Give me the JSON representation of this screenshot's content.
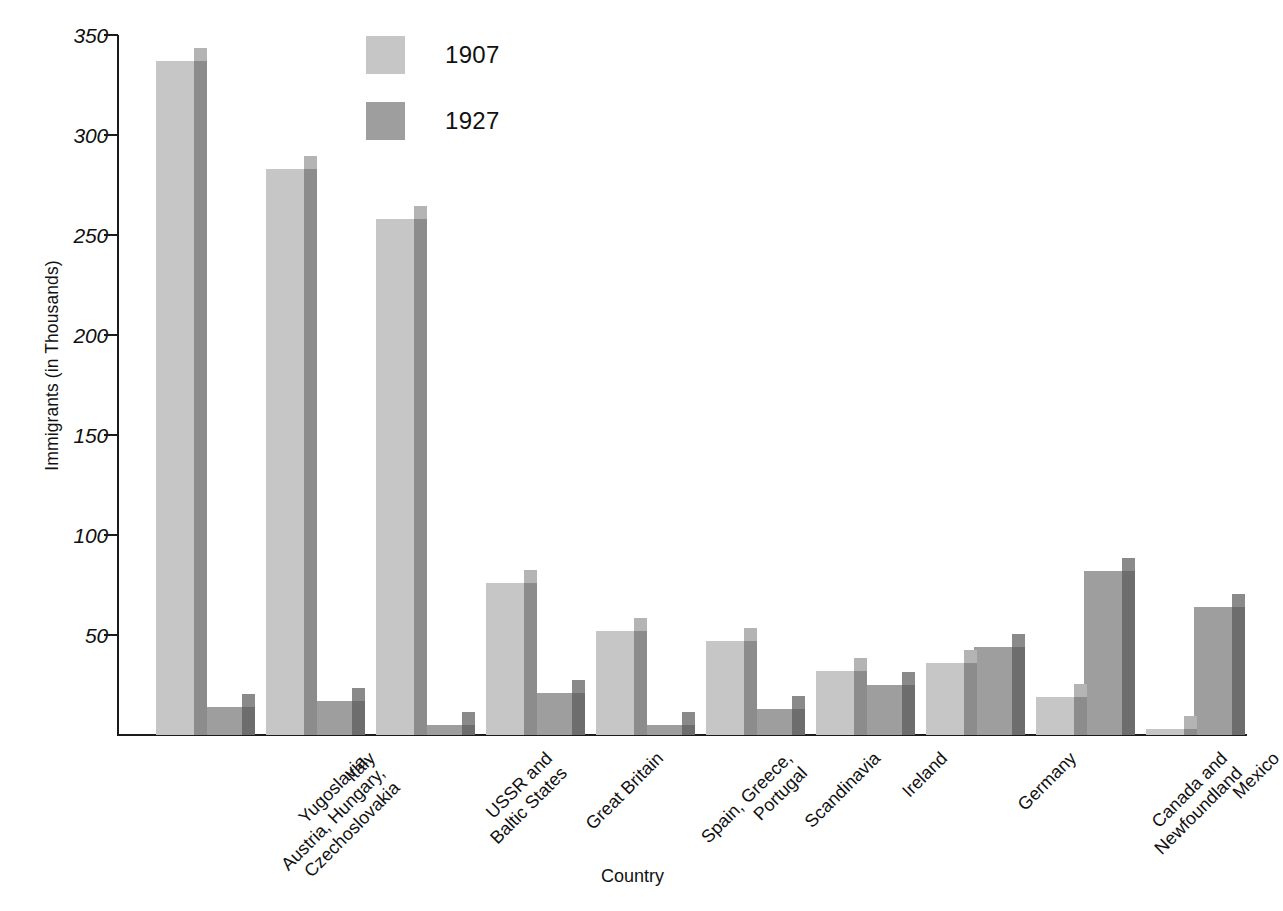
{
  "chart_data": {
    "type": "bar",
    "title": "",
    "xlabel": "Country",
    "ylabel": "Immigrants (in Thousands)",
    "ylim": [
      0,
      350
    ],
    "yticks": [
      50,
      100,
      150,
      200,
      250,
      300,
      350
    ],
    "grid": false,
    "legend_position": "top-center",
    "categories": [
      "Yugoslavia,\nAustria, Hungary,\nCzechoslovakia",
      "Italy",
      "USSR and\nBaltic States",
      "Great Britain",
      "Spain, Greece,\nPortugal",
      "Scandinavia",
      "Ireland",
      "Germany",
      "Canada and\nNewfoundland",
      "Mexico"
    ],
    "series": [
      {
        "name": "1907",
        "color": "#c6c6c6",
        "side_color": "#8c8c8c",
        "values": [
          337,
          283,
          258,
          76,
          52,
          47,
          32,
          36,
          19,
          3
        ]
      },
      {
        "name": "1927",
        "color": "#9e9e9e",
        "side_color": "#6d6d6d",
        "values": [
          14,
          17,
          5,
          21,
          5,
          13,
          25,
          44,
          82,
          64
        ]
      }
    ]
  },
  "legend": {
    "entries": [
      {
        "label": "1907"
      },
      {
        "label": "1927"
      }
    ]
  },
  "axes": {
    "y_title": "Immigrants (in Thousands)",
    "x_title": "Country",
    "y_tick_labels": [
      "350",
      "300",
      "250",
      "200",
      "150",
      "100",
      "50"
    ]
  }
}
